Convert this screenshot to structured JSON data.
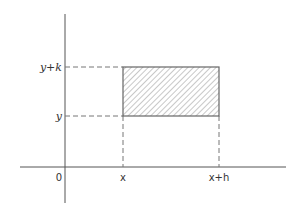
{
  "diagram": {
    "type": "coordinate-rectangle",
    "axes": {
      "origin_label": "0",
      "color": "#555555"
    },
    "rectangle": {
      "fill_pattern": "diagonal-hatch",
      "stroke_color": "#666666",
      "hatch_color": "#999999"
    },
    "x_labels": {
      "left": "x",
      "right": "x+h"
    },
    "y_labels": {
      "bottom": "y",
      "top": "y+k"
    },
    "guide_line_style": "dashed"
  }
}
